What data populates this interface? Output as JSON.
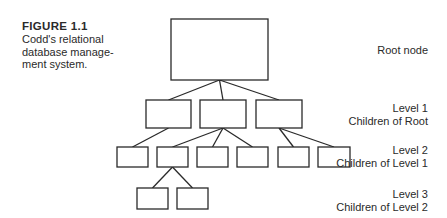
{
  "caption": {
    "figure_label": "FIGURE 1.1",
    "lines": [
      "Codd's relational",
      "database manage-",
      "ment system."
    ]
  },
  "levels": [
    {
      "id": "root",
      "title": "Root node",
      "subtitle": ""
    },
    {
      "id": "level1",
      "title": "Level 1",
      "subtitle": "Children of Root"
    },
    {
      "id": "level2",
      "title": "Level 2",
      "subtitle": "Children of Level 1"
    },
    {
      "id": "level3",
      "title": "Level 3",
      "subtitle": "Children of Level 2"
    }
  ],
  "tree": {
    "nodes": [
      {
        "id": "root",
        "level": 0,
        "x": 171,
        "y": 19,
        "w": 97,
        "h": 61
      },
      {
        "id": "l1a",
        "level": 1,
        "parent": "root",
        "x": 146,
        "y": 100,
        "w": 45,
        "h": 28
      },
      {
        "id": "l1b",
        "level": 1,
        "parent": "root",
        "x": 200,
        "y": 100,
        "w": 46,
        "h": 28
      },
      {
        "id": "l1c",
        "level": 1,
        "parent": "root",
        "x": 256,
        "y": 100,
        "w": 46,
        "h": 28
      },
      {
        "id": "l2a",
        "level": 2,
        "parent": "l1a",
        "x": 117,
        "y": 147,
        "w": 31,
        "h": 20
      },
      {
        "id": "l2b",
        "level": 2,
        "parent": "l1b",
        "x": 157,
        "y": 147,
        "w": 31,
        "h": 20
      },
      {
        "id": "l2c",
        "level": 2,
        "parent": "l1b",
        "x": 197,
        "y": 147,
        "w": 31,
        "h": 20
      },
      {
        "id": "l2d",
        "level": 2,
        "parent": "l1b",
        "x": 237,
        "y": 147,
        "w": 31,
        "h": 20
      },
      {
        "id": "l2e",
        "level": 2,
        "parent": "l1c",
        "x": 278,
        "y": 147,
        "w": 31,
        "h": 20
      },
      {
        "id": "l2f",
        "level": 2,
        "parent": "l1c",
        "x": 318,
        "y": 147,
        "w": 32,
        "h": 20
      },
      {
        "id": "l3a",
        "level": 3,
        "parent": "l2b",
        "x": 137,
        "y": 188,
        "w": 31,
        "h": 21
      },
      {
        "id": "l3b",
        "level": 3,
        "parent": "l2b",
        "x": 177,
        "y": 188,
        "w": 31,
        "h": 21
      }
    ]
  }
}
